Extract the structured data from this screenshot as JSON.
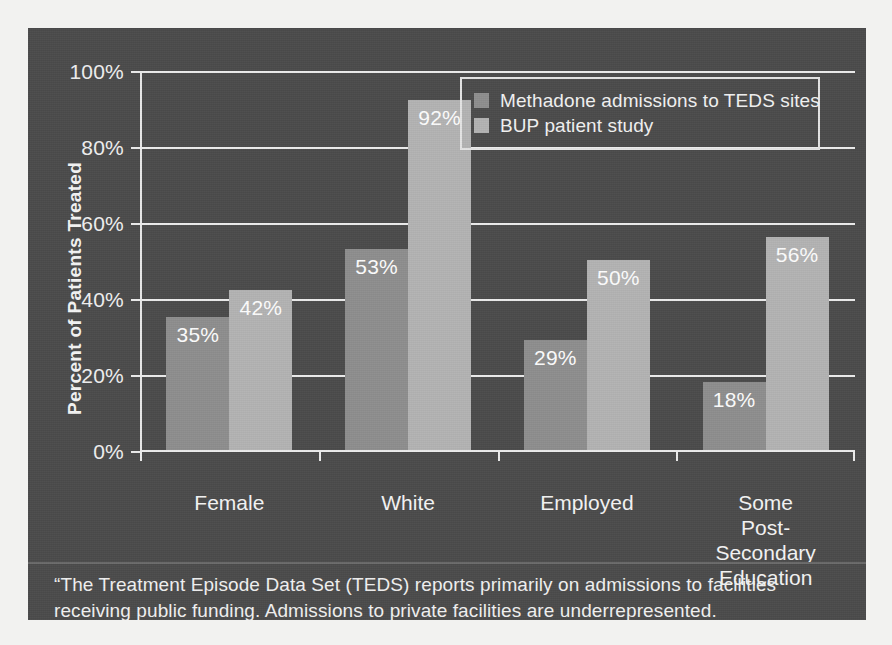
{
  "chart_data": {
    "type": "bar",
    "title": "",
    "xlabel": "",
    "ylabel": "Percent of Patients Treated",
    "ylim": [
      0,
      100
    ],
    "ytick_labels": [
      "0%",
      "20%",
      "40%",
      "60%",
      "80%",
      "100%"
    ],
    "ytick_values": [
      0,
      20,
      40,
      60,
      80,
      100
    ],
    "grid": "horizontal",
    "legend_position": "top-right",
    "categories": [
      "Female",
      "White",
      "Employed",
      "Some Post-Secondary Education"
    ],
    "category_label_lines": [
      [
        "Female"
      ],
      [
        "White"
      ],
      [
        "Employed"
      ],
      [
        "Some",
        "Post-",
        "Secondary",
        "Education"
      ]
    ],
    "series": [
      {
        "name": "Methadone admissions to TEDS sites",
        "color": "#8e8e8e",
        "values": [
          35,
          53,
          29,
          18
        ],
        "value_labels": [
          "35%",
          "53%",
          "29%",
          "18%"
        ]
      },
      {
        "name": "BUP patient study",
        "color": "#b3b3b3",
        "values": [
          42,
          92,
          50,
          56
        ],
        "value_labels": [
          "42%",
          "92%",
          "50%",
          "56%"
        ]
      }
    ]
  },
  "legend": {
    "items": [
      {
        "label": "Methadone admissions to TEDS sites",
        "color": "#8e8e8e"
      },
      {
        "label": "BUP patient study",
        "color": "#b3b3b3"
      }
    ]
  },
  "footnote": {
    "line1": "“The Treatment Episode Data Set (TEDS) reports primarily on admissions to facilities",
    "line2": "receiving public funding. Admissions to private facilities are underrepresented."
  },
  "colors": {
    "panel_background": "#4b4b4b",
    "page_background": "#f2f2f0",
    "axis": "#ececec",
    "text": "#f4f4f4",
    "series_1": "#8e8e8e",
    "series_2": "#b3b3b3"
  }
}
